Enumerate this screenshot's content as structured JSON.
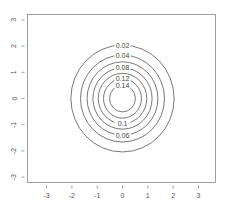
{
  "chart_data": {
    "type": "contour",
    "title": "",
    "xlabel": "",
    "ylabel": "",
    "xlim": [
      -3.5,
      3.5
    ],
    "ylim": [
      -3.5,
      3.5
    ],
    "x_ticks": [
      -3,
      -2,
      -1,
      0,
      1,
      2,
      3
    ],
    "y_ticks": [
      -3,
      -2,
      -1,
      0,
      1,
      2,
      3
    ],
    "x_tick_labels": [
      "-3",
      "-2",
      "-1",
      "0",
      "1",
      "2",
      "3"
    ],
    "y_tick_labels": [
      "-3",
      "-2",
      "-1",
      "0",
      "1",
      "2",
      "3"
    ],
    "grid": false,
    "center": [
      0,
      0
    ],
    "levels": [
      {
        "value": 0.02,
        "label": "0.02",
        "radius": 2.04,
        "label_pos": "top"
      },
      {
        "value": 0.04,
        "label": "0.04",
        "radius": 1.66,
        "label_pos": "top"
      },
      {
        "value": 0.06,
        "label": "0.06",
        "radius": 1.4,
        "label_pos": "bottom"
      },
      {
        "value": 0.08,
        "label": "0.08",
        "radius": 1.17,
        "label_pos": "top"
      },
      {
        "value": 0.1,
        "label": "0.1",
        "radius": 0.96,
        "label_pos": "bottom"
      },
      {
        "value": 0.12,
        "label": "0.12",
        "radius": 0.75,
        "label_pos": "top"
      },
      {
        "value": 0.14,
        "label": "0.14",
        "radius": 0.51,
        "label_pos": "top"
      }
    ]
  }
}
